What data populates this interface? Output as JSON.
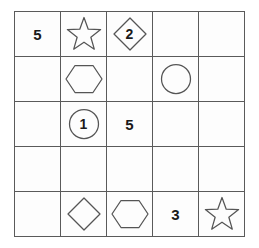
{
  "puzzle": {
    "title": "shape-number-grid",
    "grid": {
      "rows": 5,
      "columns": 5,
      "line_color": "#5a5a5a",
      "shape_stroke_color": "#555555",
      "number_color": "#1a1a1a",
      "background": "#ffffff"
    },
    "cells": [
      {
        "row": 1,
        "col": 1,
        "shape": "none",
        "number": "5",
        "label": "cell-r1c1"
      },
      {
        "row": 1,
        "col": 2,
        "shape": "star",
        "number": "",
        "label": "cell-r1c2"
      },
      {
        "row": 1,
        "col": 3,
        "shape": "diamond",
        "number": "2",
        "label": "cell-r1c3"
      },
      {
        "row": 1,
        "col": 4,
        "shape": "none",
        "number": "",
        "label": "cell-r1c4"
      },
      {
        "row": 1,
        "col": 5,
        "shape": "none",
        "number": "",
        "label": "cell-r1c5"
      },
      {
        "row": 2,
        "col": 1,
        "shape": "none",
        "number": "",
        "label": "cell-r2c1"
      },
      {
        "row": 2,
        "col": 2,
        "shape": "hexagon",
        "number": "",
        "label": "cell-r2c2"
      },
      {
        "row": 2,
        "col": 3,
        "shape": "none",
        "number": "",
        "label": "cell-r2c3"
      },
      {
        "row": 2,
        "col": 4,
        "shape": "circle",
        "number": "",
        "label": "cell-r2c4"
      },
      {
        "row": 2,
        "col": 5,
        "shape": "none",
        "number": "",
        "label": "cell-r2c5"
      },
      {
        "row": 3,
        "col": 1,
        "shape": "none",
        "number": "",
        "label": "cell-r3c1"
      },
      {
        "row": 3,
        "col": 2,
        "shape": "circle",
        "number": "1",
        "label": "cell-r3c2"
      },
      {
        "row": 3,
        "col": 3,
        "shape": "none",
        "number": "5",
        "label": "cell-r3c3"
      },
      {
        "row": 3,
        "col": 4,
        "shape": "none",
        "number": "",
        "label": "cell-r3c4"
      },
      {
        "row": 3,
        "col": 5,
        "shape": "none",
        "number": "",
        "label": "cell-r3c5"
      },
      {
        "row": 4,
        "col": 1,
        "shape": "none",
        "number": "",
        "label": "cell-r4c1"
      },
      {
        "row": 4,
        "col": 2,
        "shape": "none",
        "number": "",
        "label": "cell-r4c2"
      },
      {
        "row": 4,
        "col": 3,
        "shape": "none",
        "number": "",
        "label": "cell-r4c3"
      },
      {
        "row": 4,
        "col": 4,
        "shape": "none",
        "number": "",
        "label": "cell-r4c4"
      },
      {
        "row": 4,
        "col": 5,
        "shape": "none",
        "number": "",
        "label": "cell-r4c5"
      },
      {
        "row": 5,
        "col": 1,
        "shape": "none",
        "number": "",
        "label": "cell-r5c1"
      },
      {
        "row": 5,
        "col": 2,
        "shape": "diamond",
        "number": "",
        "label": "cell-r5c2"
      },
      {
        "row": 5,
        "col": 3,
        "shape": "hexagon",
        "number": "",
        "label": "cell-r5c3"
      },
      {
        "row": 5,
        "col": 4,
        "shape": "none",
        "number": "3",
        "label": "cell-r5c4"
      },
      {
        "row": 5,
        "col": 5,
        "shape": "star",
        "number": "",
        "label": "cell-r5c5"
      }
    ]
  }
}
